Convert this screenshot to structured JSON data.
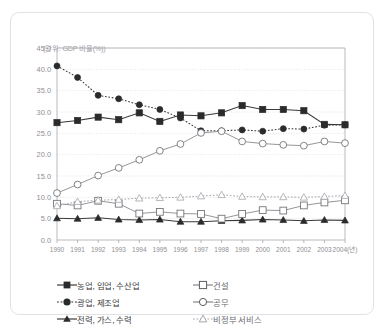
{
  "figure": {
    "unit_label": "(단위: GDP 비율(%))"
  },
  "legend": {
    "rows": [
      [
        {
          "label": "농업, 임업, 수산업",
          "marker": "filled-square-icon",
          "line": "solid"
        },
        {
          "label": "건설",
          "marker": "open-square-icon",
          "line": "solid"
        }
      ],
      [
        {
          "label": "광업, 제조업",
          "marker": "filled-circle-icon",
          "line": "dotted"
        },
        {
          "label": "공무",
          "marker": "open-circle-icon",
          "line": "solid"
        }
      ],
      [
        {
          "label": "전력, 가스, 수력",
          "marker": "filled-triangle-icon",
          "line": "solid"
        },
        {
          "label": "비정부 서비스",
          "marker": "open-triangle-icon",
          "line": "dotted"
        }
      ]
    ]
  },
  "chart_data": {
    "type": "line",
    "title": "",
    "subtitle": "",
    "xlabel": "",
    "ylabel": "(단위: GDP 비율(%))",
    "xlim": [
      1990,
      2004
    ],
    "ylim": [
      0.0,
      45.0
    ],
    "ytick_step": 5.0,
    "grid": true,
    "legend_position": "bottom",
    "categories": [
      "1990",
      "1991",
      "1992",
      "1993",
      "1994",
      "1995",
      "1996",
      "1997",
      "1998",
      "1999",
      "2000",
      "2001",
      "2002",
      "2003",
      "2004(년)"
    ],
    "x": [
      1990,
      1991,
      1992,
      1993,
      1994,
      1995,
      1996,
      1997,
      1998,
      1999,
      2000,
      2001,
      2002,
      2003,
      2004
    ],
    "ytick_labels": [
      "45.0",
      "40.0",
      "35.0",
      "30.0",
      "25.0",
      "20.0",
      "15.0",
      "10.0",
      "5.0",
      "0.0"
    ],
    "ytick_values": [
      45.0,
      40.0,
      35.0,
      30.0,
      25.0,
      20.0,
      15.0,
      10.0,
      5.0,
      0.0
    ],
    "series": [
      {
        "name": "농업, 임업, 수산업",
        "marker": "filled-square",
        "linestyle": "solid",
        "color": "#2b2b2b",
        "values": [
          27.5,
          28.0,
          28.8,
          28.2,
          29.8,
          27.8,
          29.3,
          29.1,
          29.8,
          31.5,
          30.6,
          30.6,
          30.3,
          27.1,
          27.0
        ]
      },
      {
        "name": "광업, 제조업",
        "marker": "filled-circle",
        "linestyle": "dotted",
        "color": "#2b2b2b",
        "values": [
          40.8,
          38.1,
          33.9,
          33.1,
          31.7,
          30.6,
          28.6,
          25.6,
          25.6,
          25.8,
          25.5,
          26.1,
          26.0,
          26.9,
          27.0
        ]
      },
      {
        "name": "전력, 가스, 수력",
        "marker": "filled-triangle",
        "linestyle": "solid",
        "color": "#2b2b2b",
        "values": [
          5.1,
          5.0,
          5.2,
          4.8,
          4.7,
          4.8,
          4.3,
          4.3,
          4.5,
          4.6,
          4.8,
          4.7,
          4.5,
          4.7,
          4.6
        ]
      },
      {
        "name": "건설",
        "marker": "open-square",
        "linestyle": "solid",
        "color": "#6e6e74",
        "values": [
          8.5,
          8.1,
          9.2,
          8.5,
          6.2,
          6.6,
          6.2,
          6.1,
          5.0,
          6.1,
          7.0,
          6.9,
          8.1,
          8.8,
          9.3
        ]
      },
      {
        "name": "공무",
        "marker": "open-circle",
        "linestyle": "solid",
        "color": "#6e6e74",
        "values": [
          11.0,
          13.0,
          15.1,
          16.9,
          18.8,
          20.9,
          22.5,
          25.1,
          25.5,
          23.1,
          22.6,
          22.3,
          22.1,
          23.1,
          22.7
        ]
      },
      {
        "name": "비정부 서비스",
        "marker": "open-triangle",
        "linestyle": "dotted",
        "color": "#a5a5ab",
        "values": [
          8.0,
          9.0,
          9.3,
          9.5,
          9.8,
          9.9,
          10.0,
          10.3,
          10.6,
          10.2,
          10.1,
          10.1,
          10.0,
          10.2,
          10.4
        ]
      }
    ]
  }
}
